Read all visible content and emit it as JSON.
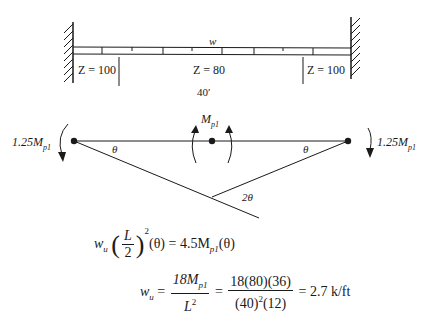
{
  "beam": {
    "load_label": "w",
    "span_label": "40′",
    "segments": [
      {
        "label": "Z = 100",
        "position": "left"
      },
      {
        "label": "Z = 80",
        "position": "middle"
      },
      {
        "label": "Z = 100",
        "position": "right"
      }
    ]
  },
  "mechanism": {
    "left_moment": "1.25M",
    "left_moment_sub": "p1",
    "right_moment": "1.25M",
    "right_moment_sub": "p1",
    "center_moment": "M",
    "center_moment_sub": "p1",
    "angle_left": "θ",
    "angle_right": "θ",
    "angle_apex": "2θ"
  },
  "equations": {
    "eq1": {
      "lhs_var": "w",
      "lhs_sub": "u",
      "frac_num": "L",
      "frac_den": "2",
      "exponent": "2",
      "theta1": "(θ) = 4.5M",
      "sub": "p1",
      "theta2": "(θ)"
    },
    "eq2": {
      "lhs_var": "w",
      "lhs_sub": "u",
      "eq_sign": "=",
      "frac1_num": "18M",
      "frac1_num_sub": "p1",
      "frac1_den": "L",
      "frac1_den_exp": "2",
      "frac2_num": "18(80)(36)",
      "frac2_den": "(40)",
      "frac2_den_exp": "2",
      "frac2_den_tail": "(12)",
      "result": "= 2.7 k/ft"
    }
  }
}
